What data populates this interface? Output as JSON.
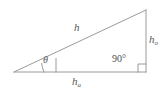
{
  "figure": {
    "background_color": "#ffffff",
    "stroke_color": "#9a9a9a",
    "text_color": "#5a5a5a"
  },
  "labels": {
    "hypotenuse": {
      "symbol": "h",
      "subscript": ""
    },
    "opposite": {
      "symbol": "h",
      "subscript": "o"
    },
    "adjacent": {
      "symbol": "h",
      "subscript": "a"
    },
    "angle_theta": "θ",
    "right_angle": "90°"
  },
  "geometry": {
    "vertex_left": {
      "x": 14,
      "y": 72
    },
    "vertex_bottom_right": {
      "x": 146,
      "y": 72
    },
    "vertex_top_right": {
      "x": 146,
      "y": 10
    },
    "theta_arc_radius": 30,
    "theta_tick": {
      "x": 56,
      "y_top": 58,
      "y_bottom": 72
    },
    "right_angle_marker": {
      "x": 138,
      "y": 64,
      "size": 8
    }
  }
}
